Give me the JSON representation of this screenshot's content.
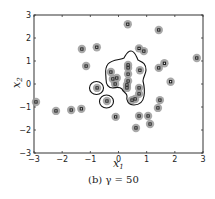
{
  "figure": {
    "caption": "(b) γ = 50",
    "xlabel": "x",
    "xlabel_sub": "1",
    "ylabel": "x",
    "ylabel_sub": "2"
  },
  "chart_data": {
    "type": "scatter",
    "title": "(b) γ = 50",
    "xlabel": "x1",
    "ylabel": "x2",
    "xlim": [
      -3,
      3
    ],
    "ylim": [
      -3,
      3
    ],
    "xticks": [
      -3,
      -2,
      -1,
      0,
      1,
      2,
      3
    ],
    "yticks": [
      -3,
      -2,
      -1,
      0,
      1,
      2,
      3
    ],
    "grid": false,
    "legend": null,
    "annotations": [
      "Black contour lines enclose a central cluster and two isolated points (decision boundary)"
    ],
    "series": [
      {
        "name": "data points",
        "marker": "small square with gray halo",
        "points": [
          {
            "x": 0.33,
            "y": 2.6
          },
          {
            "x": 1.43,
            "y": 2.35
          },
          {
            "x": -1.3,
            "y": 1.52
          },
          {
            "x": -0.77,
            "y": 1.6
          },
          {
            "x": 0.73,
            "y": 1.55
          },
          {
            "x": 0.9,
            "y": 1.43
          },
          {
            "x": -1.15,
            "y": 0.78
          },
          {
            "x": 2.78,
            "y": 1.13
          },
          {
            "x": 1.43,
            "y": 0.7
          },
          {
            "x": 1.63,
            "y": 0.9
          },
          {
            "x": 1.85,
            "y": 0.1
          },
          {
            "x": -2.93,
            "y": -0.78
          },
          {
            "x": -2.22,
            "y": -1.17
          },
          {
            "x": -1.68,
            "y": -1.13
          },
          {
            "x": -1.32,
            "y": -1.08
          },
          {
            "x": -0.76,
            "y": -0.17
          },
          {
            "x": -0.41,
            "y": -0.74
          },
          {
            "x": -0.1,
            "y": -1.43
          },
          {
            "x": 0.73,
            "y": -1.39
          },
          {
            "x": 1.05,
            "y": -1.39
          },
          {
            "x": 1.12,
            "y": -1.74
          },
          {
            "x": 0.62,
            "y": -1.91
          },
          {
            "x": 1.47,
            "y": -0.7
          },
          {
            "x": 1.4,
            "y": -1.04
          },
          {
            "x": -0.27,
            "y": 0.52
          },
          {
            "x": 0.34,
            "y": 0.83
          },
          {
            "x": 0.34,
            "y": 0.7
          },
          {
            "x": 0.34,
            "y": 0.43
          },
          {
            "x": 0.76,
            "y": 0.6
          },
          {
            "x": -0.2,
            "y": 0.22
          },
          {
            "x": -0.06,
            "y": 0.26
          },
          {
            "x": -0.12,
            "y": 0.0
          },
          {
            "x": 0.34,
            "y": 0.13
          },
          {
            "x": 0.3,
            "y": -0.04
          },
          {
            "x": 0.3,
            "y": -0.17
          },
          {
            "x": 0.73,
            "y": -0.17
          },
          {
            "x": 0.73,
            "y": -0.43
          },
          {
            "x": 0.59,
            "y": -0.65
          },
          {
            "x": 0.48,
            "y": -0.7
          }
        ]
      }
    ]
  },
  "colors": {
    "halo": "#9a9a9a",
    "marker": "#1a1a1a",
    "contour": "#111111",
    "axis": "#333333"
  }
}
